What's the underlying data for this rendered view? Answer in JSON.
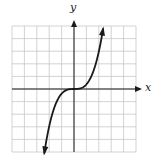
{
  "chart_data": {
    "type": "line",
    "title": "",
    "function": "y = x^3",
    "xlabel": "x",
    "ylabel": "y",
    "grid": true,
    "grid_cells": {
      "x": 10,
      "y": 10
    },
    "xlim": [
      -5,
      5
    ],
    "ylim": [
      -5,
      5
    ],
    "series": [
      {
        "name": "cubic",
        "shape": "y = k*x^3 (k≈0.37 in grid units)",
        "k": 0.37,
        "x_range": [
          -2.4,
          2.35
        ],
        "arrows_at_ends": true
      }
    ],
    "axis_arrows": {
      "x": "positive",
      "y": "positive"
    }
  },
  "labels": {
    "x_axis": "x",
    "y_axis": "y"
  },
  "colors": {
    "grid": "#c8c8c8",
    "axis": "#1a1a1a",
    "curve": "#1a1a1a"
  }
}
